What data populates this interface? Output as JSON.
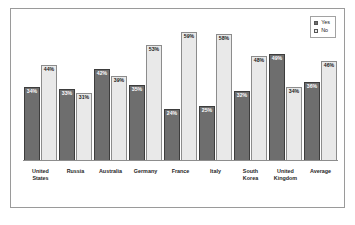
{
  "chart_data": {
    "type": "bar",
    "title": "",
    "subtitle": "",
    "xlabel": "",
    "ylabel": "",
    "ylim": [
      0,
      65
    ],
    "grid": false,
    "legend_position": "top-right",
    "categories": [
      "United\nStates",
      "Russia",
      "Australia",
      "Germany",
      "France",
      "Italy",
      "South\nKorea",
      "United\nKingdom",
      "Average"
    ],
    "series": [
      {
        "name": "Yes",
        "color": "#6e6e6e",
        "values": [
          34,
          33,
          42,
          35,
          24,
          25,
          32,
          49,
          36
        ],
        "labels": [
          "34%",
          "33%",
          "42%",
          "35%",
          "24%",
          "25%",
          "32%",
          "49%",
          "36%"
        ]
      },
      {
        "name": "No",
        "color": "#e9e9e9",
        "values": [
          44,
          31,
          39,
          53,
          59,
          58,
          48,
          34,
          46
        ],
        "labels": [
          "44%",
          "31%",
          "39%",
          "53%",
          "59%",
          "58%",
          "48%",
          "34%",
          "46%"
        ]
      }
    ]
  },
  "legend": {
    "items": [
      {
        "label": "Yes",
        "swatch": "yes"
      },
      {
        "label": "No",
        "swatch": "no"
      }
    ]
  }
}
